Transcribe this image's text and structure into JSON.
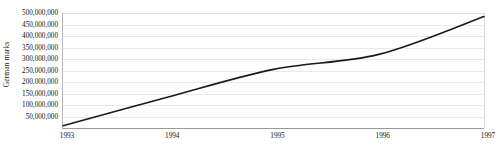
{
  "chart_data": {
    "type": "line",
    "title": "",
    "subtitle": "",
    "xlabel": "",
    "ylabel": "German marks",
    "x": [
      1993,
      1994,
      1995,
      1996,
      1997
    ],
    "categories": [
      "1993",
      "1994",
      "1995",
      "1996",
      "1997"
    ],
    "values": [
      10000000,
      135000000,
      255000000,
      320000000,
      485000000
    ],
    "series": [
      {
        "name": "German marks",
        "values": [
          10000000,
          135000000,
          255000000,
          320000000,
          485000000
        ]
      }
    ],
    "xlim": [
      1993,
      1997
    ],
    "ylim": [
      0,
      500000000
    ],
    "ytick_values": [
      50000000,
      100000000,
      150000000,
      200000000,
      250000000,
      300000000,
      350000000,
      400000000,
      450000000,
      500000000
    ],
    "ytick_labels": [
      "50,000,000",
      "100,000,000",
      "150,000,000",
      "200,000,000",
      "250,000,000",
      "300,000,000",
      "350,000,000",
      "400,000,000",
      "450,000,000",
      "500,000,000"
    ],
    "xtick_labels": [
      "1993",
      "1994",
      "1995",
      "1996",
      "1997"
    ],
    "grid": true,
    "grid_axis": "y",
    "legend": false,
    "legend_position": "none",
    "line_color": "#1a1a1a",
    "grid_color": "#e9e9e9",
    "axis_color": "#9a9a9a",
    "background_color": "#ffffff",
    "annotations": []
  }
}
